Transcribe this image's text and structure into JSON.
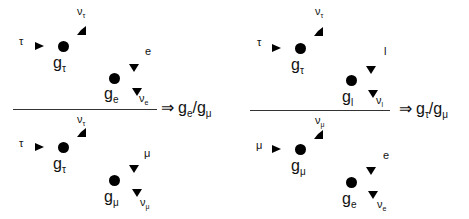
{
  "left_panel": {
    "top": {
      "incoming": {
        "label": "τ"
      },
      "vertex1": {
        "g": "g",
        "sub": "τ"
      },
      "nu1": {
        "label": "ν",
        "sub": "τ"
      },
      "outgoing": {
        "label": "e"
      },
      "vertex2": {
        "g": "g",
        "sub": "e"
      },
      "nu2": {
        "label": "ν",
        "sub": "e"
      }
    },
    "bottom": {
      "incoming": {
        "label": "τ"
      },
      "vertex1": {
        "g": "g",
        "sub": "τ"
      },
      "nu1": {
        "label": "ν",
        "sub": "τ"
      },
      "outgoing": {
        "label": "μ"
      },
      "vertex2": {
        "g": "g",
        "sub": "μ"
      },
      "nu2": {
        "label": "ν",
        "sub": "μ"
      }
    },
    "result": {
      "arrow": "⇒",
      "num": "g",
      "num_sub": "e",
      "slash": "/",
      "den": "g",
      "den_sub": "μ"
    }
  },
  "right_panel": {
    "top": {
      "incoming": {
        "label": "τ"
      },
      "vertex1": {
        "g": "g",
        "sub": "τ"
      },
      "nu1": {
        "label": "ν",
        "sub": "τ"
      },
      "outgoing": {
        "label": "l"
      },
      "vertex2": {
        "g": "g",
        "sub": "l"
      },
      "nu2": {
        "label": "ν",
        "sub": "l"
      }
    },
    "bottom": {
      "incoming": {
        "label": "μ"
      },
      "vertex1": {
        "g": "g",
        "sub": "μ"
      },
      "nu1": {
        "label": "ν",
        "sub": "μ"
      },
      "outgoing": {
        "label": "e"
      },
      "vertex2": {
        "g": "g",
        "sub": "e"
      },
      "nu2": {
        "label": "ν",
        "sub": "e"
      }
    },
    "result": {
      "arrow": "⇒",
      "num": "g",
      "num_sub": "τ",
      "slash": "/",
      "den": "g",
      "den_sub": "μ"
    }
  }
}
